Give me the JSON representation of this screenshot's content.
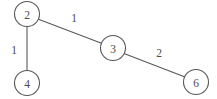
{
  "diagram": {
    "type": "undirected-weighted-graph",
    "background_color": "#ffffff",
    "stroke_color": "#58585a",
    "text_color": "#4c4c4e",
    "nodes": [
      {
        "id": "2",
        "label": "2",
        "cx": 27,
        "cy": 14,
        "r": 12.5
      },
      {
        "id": "4",
        "label": "4",
        "cx": 27,
        "cy": 83,
        "r": 12.5
      },
      {
        "id": "3",
        "label": "3",
        "cx": 113,
        "cy": 48,
        "r": 12.5
      },
      {
        "id": "6",
        "label": "6",
        "cx": 196,
        "cy": 82,
        "r": 12.5
      }
    ],
    "edges": [
      {
        "id": "edge-2-4",
        "from": "2",
        "to": "4",
        "weight": "1",
        "x1": 27,
        "y1": 26.5,
        "x2": 27,
        "y2": 70.5,
        "label_x": 14,
        "label_y": 50
      },
      {
        "id": "edge-2-3",
        "from": "2",
        "to": "3",
        "weight": "1",
        "x1": 38.5,
        "y1": 19.3,
        "x2": 101.5,
        "y2": 43.2,
        "label_x": 74,
        "label_y": 18
      },
      {
        "id": "edge-3-6",
        "from": "3",
        "to": "6",
        "weight": "2",
        "x1": 124.6,
        "y1": 53.8,
        "x2": 184.4,
        "y2": 76.8,
        "label_x": 159,
        "label_y": 53
      }
    ]
  }
}
